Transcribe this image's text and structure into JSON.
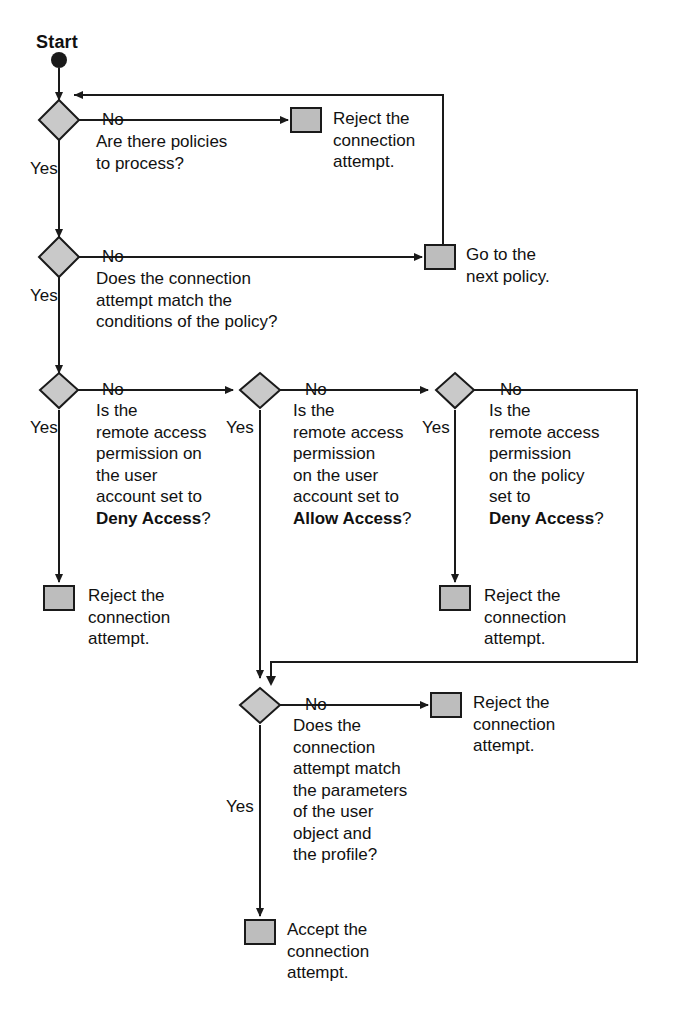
{
  "diagram": {
    "title": "Start",
    "colors": {
      "diamond_fill": "#c9c9c9",
      "box_fill": "#bdbdbd",
      "stroke": "#1a1a1a",
      "background": "#ffffff"
    },
    "start_label": "Start",
    "decisions": [
      {
        "id": "d1",
        "text": "Are there policies\nto process?",
        "no_label": "No",
        "yes_label": "Yes"
      },
      {
        "id": "d2",
        "text": "Does the connection\nattempt match the\nconditions of the policy?",
        "no_label": "No",
        "yes_label": "Yes"
      },
      {
        "id": "d3",
        "text_pre": "Is the\nremote access\npermission on\nthe user\naccount set to\n",
        "text_bold": "Deny Access",
        "text_post": "?",
        "no_label": "No",
        "yes_label": "Yes"
      },
      {
        "id": "d4",
        "text_pre": "Is the\nremote access\npermission\non the user\naccount set to\n",
        "text_bold": "Allow Access",
        "text_post": "?",
        "no_label": "No",
        "yes_label": "Yes"
      },
      {
        "id": "d5",
        "text_pre": "Is the\nremote access\npermission\non the policy\nset to\n",
        "text_bold": "Deny Access",
        "text_post": "?",
        "no_label": "No",
        "yes_label": "Yes"
      },
      {
        "id": "d6",
        "text": "Does the\nconnection\nattempt match\nthe parameters\nof the user\nobject and\nthe profile?",
        "no_label": "No",
        "yes_label": "Yes"
      }
    ],
    "terminals": [
      {
        "id": "t1",
        "text": "Reject the\nconnection\nattempt."
      },
      {
        "id": "t2",
        "text": "Go to the\nnext policy."
      },
      {
        "id": "t3",
        "text": "Reject the\nconnection\nattempt."
      },
      {
        "id": "t4",
        "text": "Reject the\nconnection\nattempt."
      },
      {
        "id": "t5",
        "text": "Reject the\nconnection\nattempt."
      },
      {
        "id": "t6",
        "text": "Accept the\nconnection\nattempt."
      }
    ]
  }
}
